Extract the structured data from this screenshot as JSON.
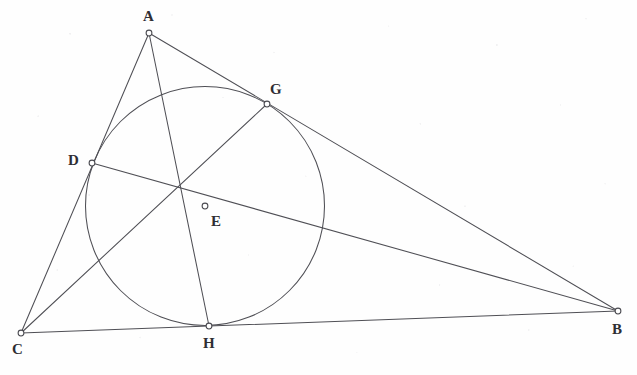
{
  "figure": {
    "kind": "euclidean-geometry-diagram",
    "canvas": {
      "width": 637,
      "height": 375
    },
    "colors": {
      "background": "#fefefe",
      "stroke": "#4f4f55",
      "marker_fill": "#ffffff",
      "label_text": "#2e2e33"
    }
  },
  "points": {
    "A": {
      "label": "A",
      "x": 149,
      "y": 33,
      "label_x": 143,
      "label_y": 9,
      "role": "triangle-vertex"
    },
    "B": {
      "label": "B",
      "x": 618,
      "y": 311,
      "label_x": 612,
      "label_y": 322,
      "role": "triangle-vertex"
    },
    "C": {
      "label": "C",
      "x": 21,
      "y": 333,
      "label_x": 12,
      "label_y": 342,
      "role": "triangle-vertex"
    },
    "D": {
      "label": "D",
      "x": 92,
      "y": 163,
      "label_x": 68,
      "label_y": 153,
      "role": "tangency-point-on-CA"
    },
    "E": {
      "label": "E",
      "x": 205,
      "y": 206,
      "label_x": 211,
      "label_y": 214,
      "role": "incenter"
    },
    "G": {
      "label": "G",
      "x": 267,
      "y": 104,
      "label_x": 270,
      "label_y": 82,
      "role": "tangency-point-on-AB"
    },
    "H": {
      "label": "H",
      "x": 209,
      "y": 326,
      "label_x": 203,
      "label_y": 336,
      "role": "tangency-point-on-BC"
    }
  },
  "incircle": {
    "name": "incircle",
    "center_x": 205,
    "center_y": 206,
    "radius": 119.5
  },
  "segments": [
    {
      "name": "side-AB",
      "from": "A",
      "to": "B",
      "kind": "triangle-side"
    },
    {
      "name": "side-BC",
      "from": "B",
      "to": "C",
      "kind": "triangle-side"
    },
    {
      "name": "side-CA",
      "from": "C",
      "to": "A",
      "kind": "triangle-side"
    },
    {
      "name": "bisector-A-to-H",
      "from": "A",
      "to": "H",
      "kind": "angle-bisector"
    },
    {
      "name": "bisector-C-to-G",
      "from": "C",
      "to": "G",
      "kind": "angle-bisector"
    },
    {
      "name": "bisector-B-to-D",
      "from": "B",
      "to": "D",
      "kind": "angle-bisector"
    }
  ],
  "vertex_markers": [
    "A",
    "B",
    "C",
    "D",
    "E",
    "G",
    "H"
  ]
}
